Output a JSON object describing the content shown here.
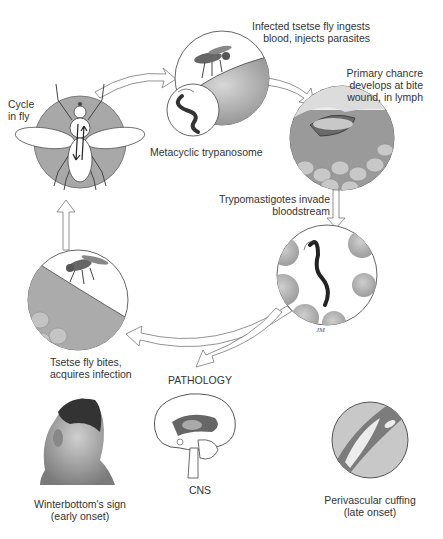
{
  "diagram": {
    "colors": {
      "line": "#555555",
      "arrow_fill": "#ffffff",
      "skin": "#9a9a9a",
      "cell": "#b8b8b8",
      "fly_circle": "#a6a6a6",
      "text": "#333333"
    },
    "cycle_stages": [
      {
        "id": "cycle-in-fly",
        "label_lines": [
          "Cycle",
          "in fly"
        ],
        "icon": "tsetse-fly-anatomy-icon"
      },
      {
        "id": "infected-fly-bites",
        "label_lines": [
          "Infected tsetse fly ingests",
          "blood, injects parasites"
        ],
        "icon": "tsetse-fly-on-skin-icon",
        "inset_label": "Metacyclic trypanosome",
        "inset_icon": "metacyclic-trypanosome-icon"
      },
      {
        "id": "primary-chancre",
        "label_lines": [
          "Primary chancre",
          "develops at bite",
          "wound, in lymph"
        ],
        "icon": "chancre-skin-lesion-icon"
      },
      {
        "id": "bloodstream-invasion",
        "label_lines": [
          "Trypomastigotes invade",
          "bloodstream"
        ],
        "icon": "trypomastigote-in-blood-icon"
      },
      {
        "id": "fly-acquires-infection",
        "label_lines": [
          "Tsetse fly bites,",
          "acquires infection"
        ],
        "icon": "tsetse-fly-feeding-icon"
      }
    ],
    "pathology": {
      "heading": "PATHOLOGY",
      "items": [
        {
          "id": "winterbottoms-sign",
          "label_lines": [
            "Winterbottom's sign",
            "(early onset)"
          ],
          "icon": "head-neck-lymph-node-icon"
        },
        {
          "id": "cns",
          "label_lines": [
            "CNS"
          ],
          "icon": "brain-sagittal-icon"
        },
        {
          "id": "perivascular-cuffing",
          "label_lines": [
            "Perivascular cuffing",
            "(late onset)"
          ],
          "icon": "perivascular-cuffing-histology-icon"
        }
      ]
    },
    "artist_signature": "JM"
  }
}
